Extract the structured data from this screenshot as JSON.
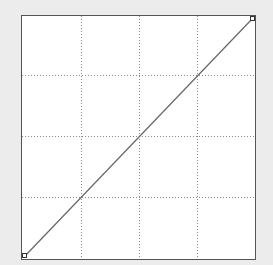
{
  "curves_editor": {
    "grid_divisions": 4,
    "colors": {
      "background": "#ececec",
      "plot_background": "#ffffff",
      "border": "#555555",
      "grid": "#888888",
      "curve": "#666666",
      "handle": "#333333"
    },
    "curve_points": [
      {
        "input": 0,
        "output": 0
      },
      {
        "input": 255,
        "output": 255
      }
    ]
  }
}
